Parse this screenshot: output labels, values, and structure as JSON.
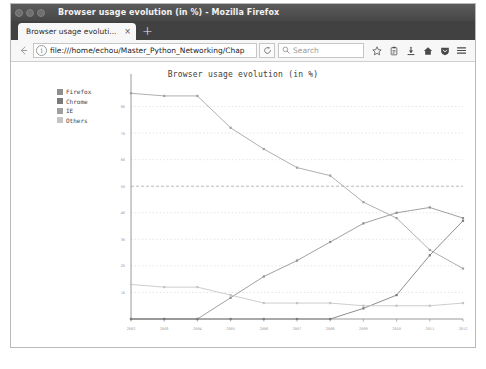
{
  "window": {
    "title": "Browser usage evolution (in %) - Mozilla Firefox",
    "controls": [
      "close",
      "minimize",
      "maximize"
    ]
  },
  "tab_strip": {
    "tabs": [
      {
        "label": "Browser usage evoluti...",
        "close_label": "×",
        "active": true
      }
    ],
    "new_tab_label": "+"
  },
  "toolbar": {
    "back_icon": "←",
    "forward_icon": "→",
    "identity_icon": "i",
    "url": "file:///home/echou/Master_Python_Networking/Chap",
    "reload_icon": "⟳",
    "search": {
      "magnifier_icon": "⌕",
      "placeholder": "Search",
      "value": ""
    },
    "buttons": [
      {
        "name": "bookmark-star-icon",
        "label": "☆"
      },
      {
        "name": "library-icon",
        "label": "Ὕ2"
      },
      {
        "name": "download-icon",
        "label": "↓"
      },
      {
        "name": "home-icon",
        "label": "⌂"
      },
      {
        "name": "pocket-shield-icon",
        "label": "▽"
      },
      {
        "name": "hamburger-menu-icon",
        "label": "≡"
      }
    ]
  },
  "chart_data": {
    "type": "line",
    "title": "Browser usage evolution (in %)",
    "xlabel": "",
    "ylabel": "",
    "x": [
      2002,
      2003,
      2004,
      2005,
      2006,
      2007,
      2008,
      2009,
      2010,
      2011,
      2012
    ],
    "xlim": [
      2002,
      2012
    ],
    "ylim": [
      0,
      90
    ],
    "yticks": [
      0,
      10,
      20,
      30,
      40,
      50,
      60,
      70,
      80
    ],
    "xticks": [
      "2002",
      "2003",
      "2004",
      "2005",
      "2006",
      "2007",
      "2008",
      "2009",
      "2010",
      "2011",
      "2012"
    ],
    "grid": true,
    "grid_axis": "y",
    "legend_position": "upper-left-outside",
    "series": [
      {
        "name": "Firefox",
        "color": "#8f8f8f",
        "values": [
          0,
          0,
          0,
          8,
          16,
          22,
          29,
          36,
          40,
          42,
          38
        ]
      },
      {
        "name": "Chrome",
        "color": "#7a7a7a",
        "values": [
          0,
          0,
          0,
          0,
          0,
          0,
          0,
          4,
          9,
          24,
          37
        ]
      },
      {
        "name": "IE",
        "color": "#a0a0a0",
        "values": [
          85,
          84,
          84,
          72,
          64,
          57,
          54,
          44,
          38,
          26,
          19
        ]
      },
      {
        "name": "Others",
        "color": "#c4c4c4",
        "values": [
          13,
          12,
          12,
          9,
          6,
          6,
          6,
          5,
          5,
          5,
          6
        ]
      }
    ]
  }
}
